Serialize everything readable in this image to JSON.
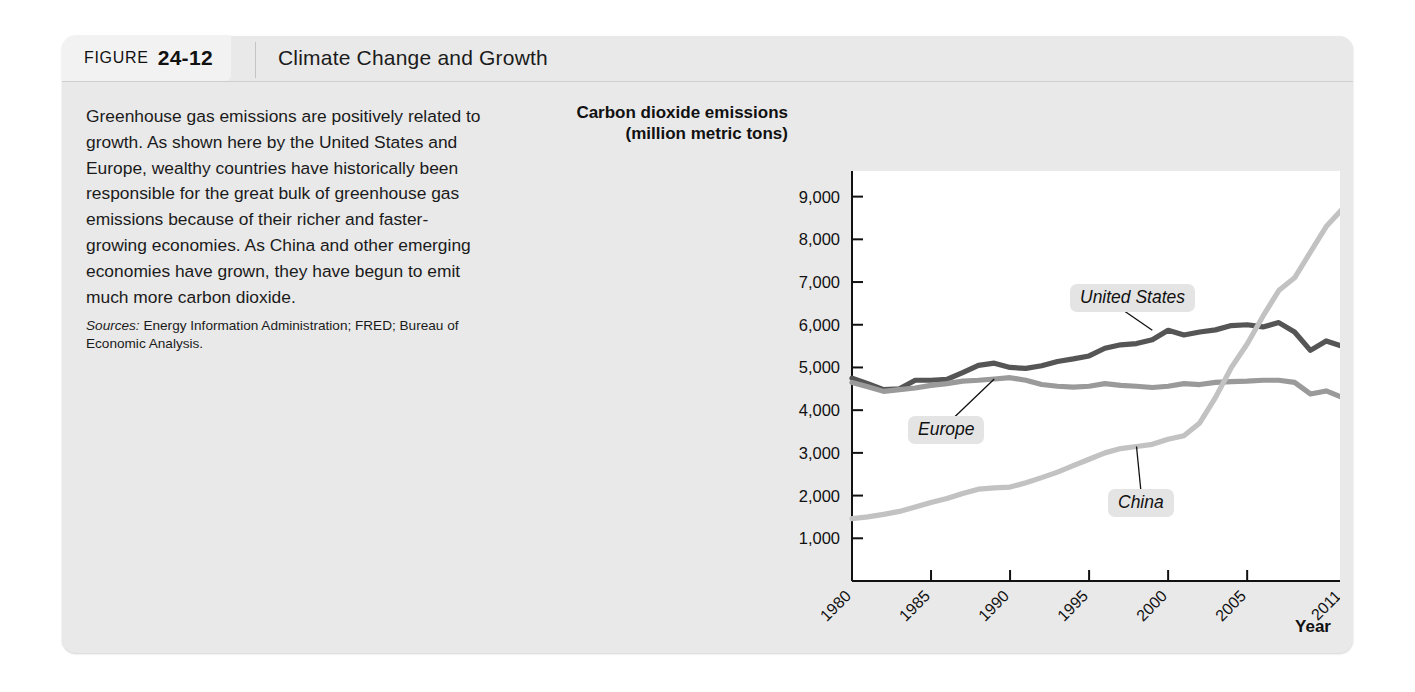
{
  "figure": {
    "tab_word": "FIGURE",
    "tab_number": "24-12",
    "title": "Climate Change and Growth"
  },
  "caption": {
    "body": "Greenhouse gas emissions are positively related to growth. As shown here by the United States and Europe, wealthy countries have historically been responsible for the great bulk of greenhouse gas emissions because of their richer and faster-growing economies. As China and other emerging economies have grown, they have begun to emit much more carbon dioxide.",
    "sources_label": "Sources:",
    "sources_text": " Energy Information Administration; FRED; Bureau of Economic Analysis."
  },
  "chart_data": {
    "type": "line",
    "title": "Climate Change and Growth",
    "ylabel": "Carbon dioxide emissions (million metric tons)",
    "ylabel_line1": "Carbon dioxide emissions",
    "ylabel_line2": "(million metric tons)",
    "xlabel": "Year",
    "ylim": [
      0,
      9600
    ],
    "xlim": [
      1980,
      2011
    ],
    "ytick_labels": [
      "9,000",
      "8,000",
      "7,000",
      "6,000",
      "5,000",
      "4,000",
      "3,000",
      "2,000",
      "1,000"
    ],
    "ytick_values": [
      9000,
      8000,
      7000,
      6000,
      5000,
      4000,
      3000,
      2000,
      1000
    ],
    "xtick_labels": [
      "1980",
      "1985",
      "1990",
      "1995",
      "2000",
      "2005",
      "2011"
    ],
    "xtick_values": [
      1980,
      1985,
      1990,
      1995,
      2000,
      2005,
      2011
    ],
    "grid": false,
    "legend_position": "inline-annotations",
    "x": [
      1980,
      1981,
      1982,
      1983,
      1984,
      1985,
      1986,
      1987,
      1988,
      1989,
      1990,
      1991,
      1992,
      1993,
      1994,
      1995,
      1996,
      1997,
      1998,
      1999,
      2000,
      2001,
      2002,
      2003,
      2004,
      2005,
      2006,
      2007,
      2008,
      2009,
      2010,
      2011
    ],
    "series": [
      {
        "name": "United States",
        "color": "#555555",
        "values": [
          4750,
          4620,
          4480,
          4500,
          4700,
          4700,
          4720,
          4880,
          5050,
          5100,
          5000,
          4980,
          5040,
          5140,
          5200,
          5270,
          5450,
          5530,
          5560,
          5650,
          5870,
          5760,
          5830,
          5880,
          5980,
          6000,
          5950,
          6050,
          5830,
          5400,
          5620,
          5500
        ]
      },
      {
        "name": "Europe",
        "color": "#9a9a9a",
        "values": [
          4650,
          4550,
          4440,
          4480,
          4520,
          4580,
          4620,
          4680,
          4700,
          4730,
          4760,
          4700,
          4600,
          4560,
          4540,
          4560,
          4620,
          4580,
          4560,
          4530,
          4560,
          4620,
          4600,
          4650,
          4670,
          4680,
          4700,
          4700,
          4650,
          4380,
          4450,
          4300
        ]
      },
      {
        "name": "China",
        "color": "#c2c2c2",
        "values": [
          1460,
          1500,
          1560,
          1630,
          1730,
          1840,
          1930,
          2050,
          2150,
          2180,
          2200,
          2300,
          2420,
          2550,
          2700,
          2850,
          3000,
          3100,
          3150,
          3200,
          3320,
          3400,
          3700,
          4300,
          5000,
          5550,
          6200,
          6800,
          7100,
          7700,
          8300,
          8700
        ]
      }
    ],
    "annotations": [
      {
        "label": "United States",
        "x": 1999,
        "y": 5870
      },
      {
        "label": "Europe",
        "x": 1989,
        "y": 4730
      },
      {
        "label": "China",
        "x": 1998,
        "y": 3150
      }
    ]
  }
}
